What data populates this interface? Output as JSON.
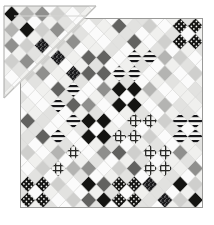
{
  "artwork": {
    "title": "Patchwork Diamond Quilt",
    "medium": "grayscale photograph",
    "description": "A square patchwork quilt photographed flat with its top-left corner folded back, revealing a triangular flap of the same diamond-lattice piecing.",
    "canvas": {
      "width": 214,
      "height": 225,
      "background": "#ffffff"
    }
  },
  "palette": {
    "white": "#fbfbfb",
    "offwhite": "#f0f0ee",
    "paleGray": "#e2e2e0",
    "lightGray": "#cfcfcd",
    "midLightGray": "#b4b4b2",
    "midGray": "#8f8f8d",
    "darkGray": "#626260",
    "charcoal": "#3a3a38",
    "black": "#141412",
    "seam": "#d8d8d6",
    "border": "#9a9a98",
    "backing": "#fdfdfd",
    "foldShadow": "#c9c9c7"
  },
  "quilt": {
    "name": "main-quilt-body",
    "corner_top_left": {
      "x": 20,
      "y": 18
    },
    "corner_top_right": {
      "x": 203,
      "y": 18
    },
    "corner_bottom_right": {
      "x": 203,
      "y": 208
    },
    "corner_bottom_left": {
      "x": 20,
      "y": 208
    },
    "grid": {
      "columns": 12,
      "rows": 12,
      "cell_width": 15.25,
      "cell_height": 15.83
    },
    "lattice_type": "argyle-diamond",
    "border_stroke": "#9a9a98",
    "border_width": 1
  },
  "fold": {
    "name": "folded-corner-flap",
    "description": "Top-left corner folded diagonally back over the quilt face.",
    "outer_triangle": [
      [
        4,
        6
      ],
      [
        96,
        6
      ],
      [
        4,
        98
      ]
    ],
    "inner_crease": [
      [
        20,
        18
      ],
      [
        84,
        18
      ],
      [
        20,
        82
      ]
    ],
    "crease_line_color": "#bfbfbd",
    "backing_color": "#fdfdfd"
  },
  "blocks": {
    "legend": {
      "0": "white",
      "1": "offwhite",
      "2": "paleGray",
      "3": "lightGray",
      "4": "midLightGray",
      "5": "midGray",
      "6": "darkGray",
      "7": "charcoal",
      "8": "black",
      "S": "horizontal-stripe",
      "D": "polka-dot-on-black",
      "G": "crosshatch-grid",
      "H": "fine-hatch",
      "P": "speckle-print"
    },
    "rows": [
      [
        "8",
        "4",
        "5",
        "3",
        "0",
        "1",
        "6",
        "2",
        "3",
        "0",
        "D",
        "D"
      ],
      [
        "4",
        "8",
        "3",
        "5",
        "1",
        "0",
        "2",
        "6",
        "0",
        "3",
        "D",
        "D"
      ],
      [
        "5",
        "3",
        "P",
        "1",
        "6",
        "6",
        "0",
        "S",
        "S",
        "4",
        "3",
        "0"
      ],
      [
        "3",
        "5",
        "1",
        "P",
        "6",
        "6",
        "S",
        "S",
        "0",
        "4",
        "0",
        "3"
      ],
      [
        "0",
        "1",
        "6",
        "S",
        "0",
        "5",
        "8",
        "8",
        "4",
        "0",
        "1",
        "2"
      ],
      [
        "1",
        "0",
        "S",
        "6",
        "5",
        "0",
        "8",
        "8",
        "0",
        "4",
        "2",
        "1"
      ],
      [
        "6",
        "2",
        "0",
        "S",
        "8",
        "8",
        "0",
        "G",
        "G",
        "3",
        "S",
        "S"
      ],
      [
        "2",
        "6",
        "S",
        "0",
        "8",
        "8",
        "G",
        "G",
        "3",
        "0",
        "S",
        "S"
      ],
      [
        "3",
        "0",
        "4",
        "G",
        "0",
        "5",
        "6",
        "3",
        "G",
        "G",
        "5",
        "1"
      ],
      [
        "0",
        "3",
        "G",
        "4",
        "5",
        "0",
        "3",
        "6",
        "G",
        "G",
        "1",
        "5"
      ],
      [
        "D",
        "D",
        "3",
        "0",
        "8",
        "6",
        "D",
        "D",
        "P",
        "2",
        "8",
        "3"
      ],
      [
        "D",
        "D",
        "0",
        "3",
        "6",
        "8",
        "D",
        "D",
        "2",
        "P",
        "3",
        "8"
      ]
    ]
  }
}
